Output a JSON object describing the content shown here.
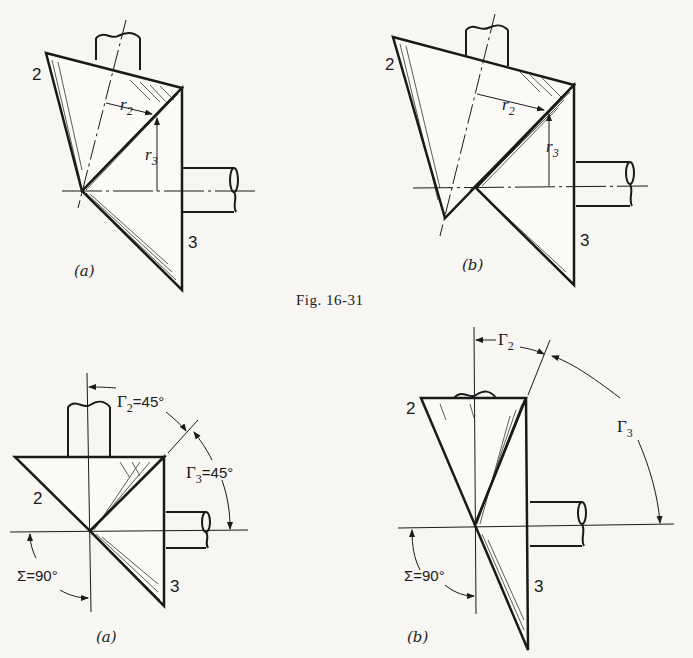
{
  "figure": {
    "caption": "Fig. 16-31",
    "top_row": [
      {
        "panel_caption": "(a)",
        "gear_labels": [
          "2",
          "3"
        ],
        "radius_labels": {
          "r2": {
            "base": "r",
            "sub": "2"
          },
          "r3": {
            "base": "r",
            "sub": "3"
          }
        }
      },
      {
        "panel_caption": "(b)",
        "gear_labels": [
          "2",
          "3"
        ],
        "radius_labels": {
          "r2": {
            "base": "r",
            "sub": "2"
          },
          "r3": {
            "base": "r",
            "sub": "3"
          }
        }
      }
    ],
    "bottom_row": [
      {
        "panel_caption": "(a)",
        "gear_labels": [
          "2",
          "3"
        ],
        "gamma2": {
          "base": "Γ",
          "sub": "2",
          "value": "=45°"
        },
        "gamma3": {
          "base": "Γ",
          "sub": "3",
          "value": "=45°"
        },
        "sigma": "Σ=90°"
      },
      {
        "panel_caption": "(b)",
        "gear_labels": [
          "2",
          "3"
        ],
        "gamma2": {
          "base": "Γ",
          "sub": "2",
          "value": ""
        },
        "gamma3": {
          "base": "Γ",
          "sub": "3",
          "value": ""
        },
        "sigma": "Σ=90°"
      }
    ]
  }
}
